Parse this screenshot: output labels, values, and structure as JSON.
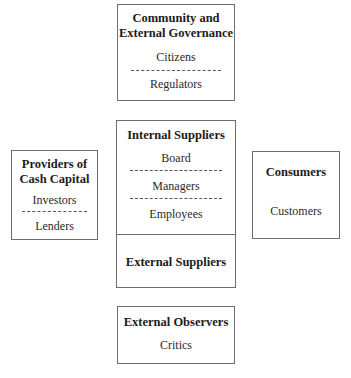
{
  "diagram": {
    "top_box": {
      "title_line1": "Community and",
      "title_line2": "External Governance",
      "items": [
        "Citizens",
        "Regulators"
      ]
    },
    "left_box": {
      "title_line1": "Providers of",
      "title_line2": "Cash Capital",
      "items": [
        "Investors",
        "Lenders"
      ]
    },
    "center_box": {
      "upper": {
        "title": "Internal Suppliers",
        "items": [
          "Board",
          "Managers",
          "Employees"
        ]
      },
      "lower": {
        "title": "External Suppliers"
      }
    },
    "right_box": {
      "title": "Consumers",
      "items": [
        "Customers"
      ]
    },
    "bottom_box": {
      "title": "External Observers",
      "items": [
        "Critics"
      ]
    },
    "colors": {
      "border": "#6e6e6e",
      "text": "#222222",
      "background": "#ffffff"
    }
  }
}
